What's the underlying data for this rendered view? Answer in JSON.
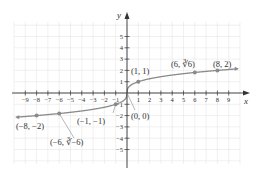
{
  "chart_data": {
    "type": "line",
    "title": "",
    "function": "y = cube root of x",
    "xlabel": "x",
    "ylabel": "y",
    "xlim": [
      -9.8,
      9.8
    ],
    "ylim": [
      -6,
      6
    ],
    "grid": true,
    "x_ticks": [
      -9,
      -8,
      -7,
      -6,
      -5,
      -4,
      -3,
      -2,
      -1,
      1,
      2,
      3,
      4,
      5,
      6,
      7,
      8,
      9
    ],
    "y_ticks": [
      -5,
      -4,
      -3,
      -2,
      -1,
      1,
      2,
      3,
      4,
      5
    ],
    "series": [
      {
        "name": "y = ∛x",
        "x": [
          -9.8,
          -8,
          -6,
          -1,
          0,
          1,
          6,
          8,
          9.8
        ],
        "y": [
          -2.14,
          -2,
          -1.817,
          -1,
          0,
          1,
          1.817,
          2,
          2.14
        ]
      }
    ],
    "points": [
      {
        "x": -8,
        "y": -2,
        "label": "(−8, −2)"
      },
      {
        "x": -6,
        "y": -1.817,
        "label": "(−6, ∛−6)"
      },
      {
        "x": -1,
        "y": -1,
        "label": "(−1, −1)"
      },
      {
        "x": 0,
        "y": 0,
        "label": "(0, 0)"
      },
      {
        "x": 1,
        "y": 1,
        "label": "(1, 1)"
      },
      {
        "x": 6,
        "y": 1.817,
        "label": "(6, ∛6)"
      },
      {
        "x": 8,
        "y": 2,
        "label": "(8, 2)"
      }
    ],
    "colors": {
      "curve": "#8a8a8a",
      "axis": "#333333",
      "grid": "#e6e6e6",
      "point": "#8a8a8a"
    }
  }
}
